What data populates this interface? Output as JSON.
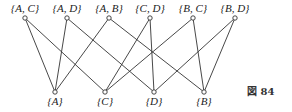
{
  "figure": {
    "caption": "図 84",
    "top_nodes": [
      {
        "id": "AC",
        "label": "{A, C}",
        "x": 25,
        "y": 18
      },
      {
        "id": "AD",
        "label": "{A, D}",
        "x": 67,
        "y": 18
      },
      {
        "id": "AB",
        "label": "{A, B}",
        "x": 109,
        "y": 18
      },
      {
        "id": "CD",
        "label": "{C, D}",
        "x": 150,
        "y": 18
      },
      {
        "id": "BC",
        "label": "{B, C}",
        "x": 193,
        "y": 18
      },
      {
        "id": "BD",
        "label": "{B, D}",
        "x": 235,
        "y": 18
      }
    ],
    "bottom_nodes": [
      {
        "id": "A",
        "label": "{A}",
        "x": 55,
        "y": 92
      },
      {
        "id": "C",
        "label": "{C}",
        "x": 105,
        "y": 92
      },
      {
        "id": "D",
        "label": "{D}",
        "x": 154,
        "y": 92
      },
      {
        "id": "B",
        "label": "{B}",
        "x": 204,
        "y": 92
      }
    ],
    "edges": [
      [
        "AC",
        "A"
      ],
      [
        "AC",
        "C"
      ],
      [
        "AD",
        "A"
      ],
      [
        "AD",
        "D"
      ],
      [
        "AB",
        "A"
      ],
      [
        "AB",
        "B"
      ],
      [
        "CD",
        "C"
      ],
      [
        "CD",
        "D"
      ],
      [
        "BC",
        "C"
      ],
      [
        "BC",
        "B"
      ],
      [
        "BD",
        "D"
      ],
      [
        "BD",
        "B"
      ]
    ]
  }
}
